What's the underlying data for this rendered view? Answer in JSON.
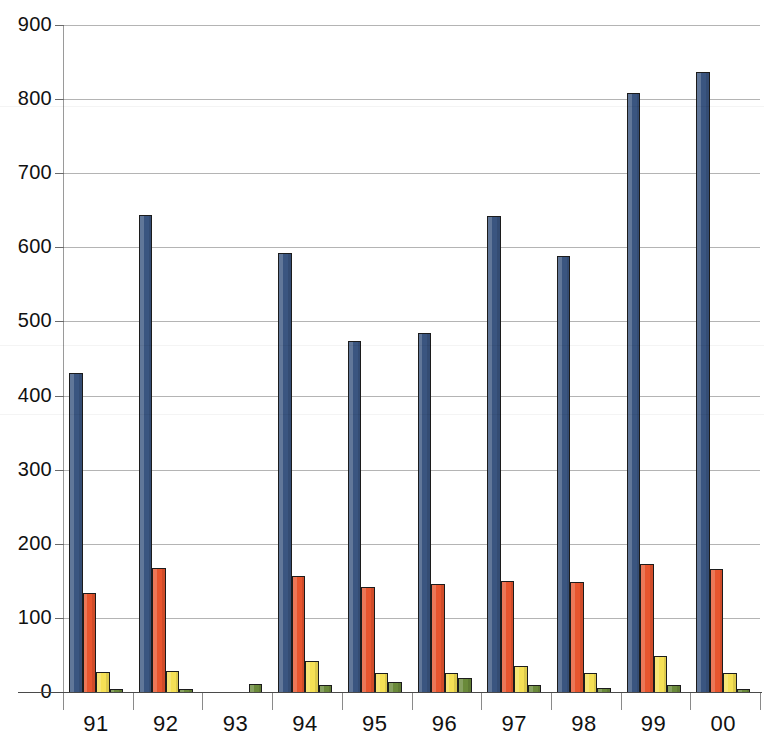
{
  "chart_data": {
    "type": "bar",
    "title": "",
    "subtitle": "",
    "xlabel": "",
    "ylabel": "",
    "grid": true,
    "legend_position": "none",
    "ylim": [
      0,
      900
    ],
    "ytick_labels": [
      "900",
      "800",
      "700",
      "600",
      "500",
      "400",
      "300",
      "200",
      "100",
      "0"
    ],
    "yticks": [
      900,
      800,
      700,
      600,
      500,
      400,
      300,
      200,
      100,
      0
    ],
    "categories": [
      "91",
      "92",
      "93",
      "94",
      "95",
      "96",
      "97",
      "98",
      "99",
      "00"
    ],
    "series": [
      {
        "name": "series-1",
        "color": "#3a5580",
        "values": [
          431,
          643,
          0,
          593,
          474,
          485,
          642,
          589,
          808,
          836
        ]
      },
      {
        "name": "series-2",
        "color": "#e8552e",
        "values": [
          133,
          167,
          0,
          157,
          142,
          146,
          150,
          149,
          173,
          166
        ]
      },
      {
        "name": "series-3",
        "color": "#f5e055",
        "values": [
          27,
          29,
          0,
          42,
          25,
          25,
          35,
          25,
          49,
          25
        ]
      },
      {
        "name": "series-4",
        "color": "#6a8a3a",
        "values": [
          4,
          3,
          11,
          9,
          13,
          19,
          9,
          6,
          9,
          2
        ]
      }
    ]
  },
  "colors": {
    "background": "#ffffff",
    "gridline": "#b4b4b4",
    "axis": "#5a5a5a",
    "text": "#111111",
    "series_1": "#3a5580",
    "series_2": "#e8552e",
    "series_3": "#f5e055",
    "series_4": "#6a8a3a",
    "bar_outline": "#1c1c1c"
  }
}
